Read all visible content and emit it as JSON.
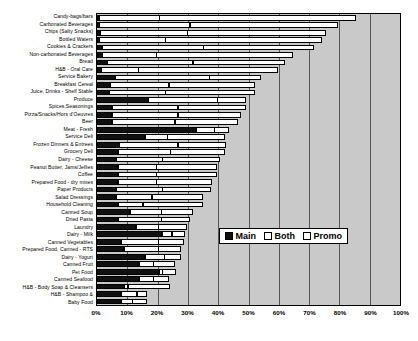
{
  "chart_data": {
    "type": "bar",
    "subtype": "stacked-horizontal-bar",
    "title": "",
    "xlabel": "",
    "ylabel": "",
    "xlim": [
      0,
      100
    ],
    "xtick_labels": [
      "0%",
      "10%",
      "20%",
      "30%",
      "40%",
      "50%",
      "60%",
      "70%",
      "80%",
      "90%",
      "100%"
    ],
    "xtick_values": [
      0,
      10,
      20,
      30,
      40,
      50,
      60,
      70,
      80,
      90,
      100
    ],
    "grid": "vertical",
    "legend_position": "lower-right-inside",
    "plot_background": "#c9c9c9",
    "categories": [
      "Candy-bags/bars",
      "Carbonated Beverages",
      "Chips (Salty Snacks)",
      "Bottled Waters",
      "Cookies & Crackers",
      "Non-carbonated Beverages",
      "Bread",
      "H&B - Oral Care",
      "Service Bakery",
      "Breakfast Cereal",
      "Juice, Drinks - Shelf Stable",
      "Produce",
      "Spices,Seasonings",
      "Pizza/Snacks/Hors d'Oeuvres",
      "Beer",
      "Meat - Fresh",
      "Service Deli",
      "Frozen Dinners & Entrees",
      "Grocery Deli",
      "Dairy - Cheese",
      "Peanut Butter, Jams/Jellies",
      "Coffee",
      "Prepared Food - dry mixes",
      "Paper Products",
      "Salad Dressings",
      "Household Cleaning",
      "Canned Soup",
      "Dried Pasta",
      "Laundry",
      "Dairy - Milk",
      "Canned Vegetables",
      "Prepared Food, Canned - RTS",
      "Dairy - Yogurt",
      "Canned Fruit",
      "Pet Food",
      "Canned Seafood",
      "H&B - Body Soap & Cleansers",
      "H&B - Shampoo &",
      "Baby Food"
    ],
    "series": [
      {
        "name": "Main",
        "color": "#101010",
        "values": [
          0.8,
          1.0,
          1.2,
          1.0,
          1.8,
          2.0,
          3.5,
          1.5,
          6.0,
          4.5,
          4.0,
          17.0,
          5.0,
          5.0,
          5.0,
          33.0,
          16.0,
          7.5,
          7.0,
          6.5,
          7.0,
          7.0,
          7.0,
          6.5,
          6.5,
          7.0,
          11.0,
          7.0,
          13.0,
          21.5,
          8.0,
          9.0,
          16.0,
          14.0,
          20.5,
          14.0,
          9.0,
          8.0,
          8.0
        ]
      },
      {
        "name": "Both",
        "color": "#ffffff",
        "values": [
          20.2,
          30.0,
          29.0,
          22.0,
          33.7,
          18.0,
          28.5,
          12.5,
          31.5,
          19.5,
          19.0,
          23.0,
          22.0,
          22.0,
          21.0,
          6.0,
          7.5,
          19.5,
          17.5,
          15.5,
          13.0,
          13.0,
          13.0,
          15.5,
          12.0,
          8.5,
          10.5,
          14.5,
          7.5,
          3.5,
          12.5,
          11.5,
          6.5,
          5.0,
          1.5,
          5.0,
          1.5,
          5.5,
          4.0
        ]
      },
      {
        "name": "Promo",
        "color": "#ffffff",
        "values": [
          65.0,
          49.0,
          45.8,
          51.5,
          36.5,
          45.0,
          30.5,
          46.0,
          17.0,
          28.5,
          29.5,
          9.5,
          22.5,
          21.0,
          21.0,
          5.0,
          19.0,
          16.0,
          18.0,
          19.0,
          20.0,
          20.0,
          18.5,
          16.0,
          17.0,
          20.0,
          10.5,
          9.5,
          9.5,
          4.5,
          8.5,
          7.5,
          5.5,
          7.0,
          4.5,
          5.0,
          14.0,
          3.5,
          5.0
        ]
      }
    ]
  },
  "legend": {
    "items": [
      {
        "label": "Main",
        "key": "main"
      },
      {
        "label": "Both",
        "key": "both"
      },
      {
        "label": "Promo",
        "key": "promo"
      }
    ]
  }
}
